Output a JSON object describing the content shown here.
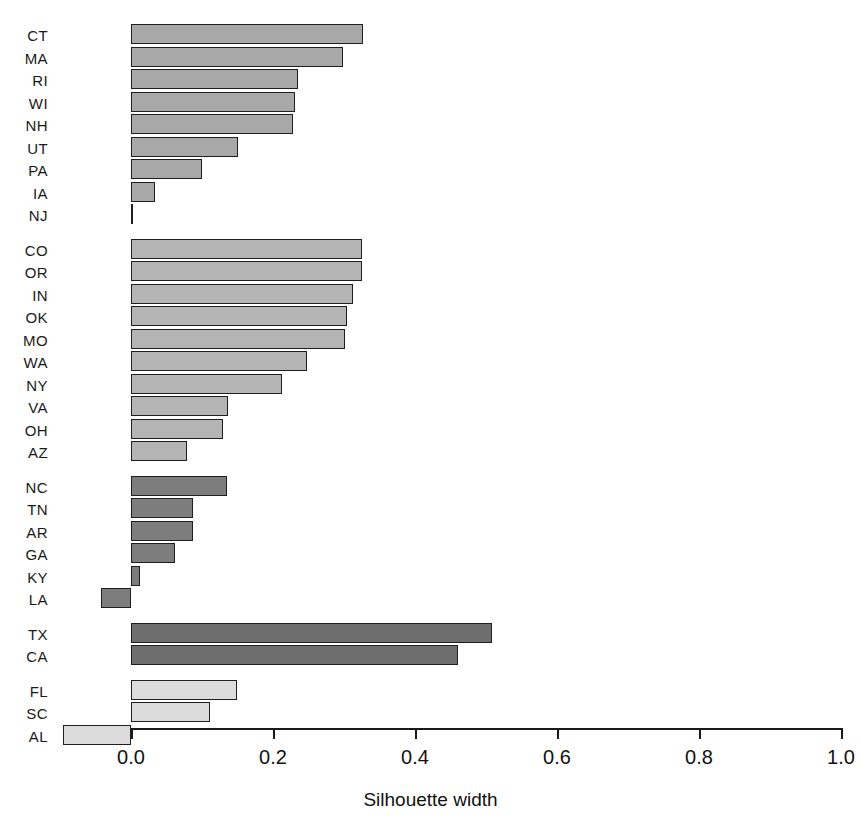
{
  "chart_data": {
    "type": "bar",
    "orientation": "horizontal",
    "title": "",
    "xlabel": "Silhouette width",
    "ylabel": "",
    "xlim": [
      -0.1,
      1.0
    ],
    "xticks": [
      "0.0",
      "0.2",
      "0.4",
      "0.6",
      "0.8",
      "1.0"
    ],
    "xtick_values": [
      0.0,
      0.2,
      0.4,
      0.6,
      0.8,
      1.0
    ],
    "grid": false,
    "legend": "none",
    "categories": [
      "CT",
      "MA",
      "RI",
      "WI",
      "NH",
      "UT",
      "PA",
      "IA",
      "NJ",
      "CO",
      "OR",
      "IN",
      "OK",
      "MO",
      "WA",
      "NY",
      "VA",
      "OH",
      "AZ",
      "NC",
      "TN",
      "AR",
      "GA",
      "KY",
      "LA",
      "TX",
      "CA",
      "FL",
      "SC",
      "AL"
    ],
    "values": [
      0.327,
      0.299,
      0.235,
      0.231,
      0.228,
      0.151,
      0.1,
      0.034,
      0.001,
      0.325,
      0.325,
      0.313,
      0.304,
      0.301,
      0.248,
      0.213,
      0.137,
      0.13,
      0.079,
      0.135,
      0.087,
      0.087,
      0.062,
      0.013,
      -0.042,
      0.508,
      0.461,
      0.149,
      0.111,
      -0.096
    ],
    "clusters": [
      {
        "index": 1,
        "color": "#a8a8a8",
        "members": [
          {
            "label": "CT",
            "value": 0.327
          },
          {
            "label": "MA",
            "value": 0.299
          },
          {
            "label": "RI",
            "value": 0.235
          },
          {
            "label": "WI",
            "value": 0.231
          },
          {
            "label": "NH",
            "value": 0.228
          },
          {
            "label": "UT",
            "value": 0.151
          },
          {
            "label": "PA",
            "value": 0.1
          },
          {
            "label": "IA",
            "value": 0.034
          },
          {
            "label": "NJ",
            "value": 0.001
          }
        ]
      },
      {
        "index": 2,
        "color": "#b4b4b4",
        "members": [
          {
            "label": "CO",
            "value": 0.325
          },
          {
            "label": "OR",
            "value": 0.325
          },
          {
            "label": "IN",
            "value": 0.313
          },
          {
            "label": "OK",
            "value": 0.304
          },
          {
            "label": "MO",
            "value": 0.301
          },
          {
            "label": "WA",
            "value": 0.248
          },
          {
            "label": "NY",
            "value": 0.213
          },
          {
            "label": "VA",
            "value": 0.137
          },
          {
            "label": "OH",
            "value": 0.13
          },
          {
            "label": "AZ",
            "value": 0.079
          }
        ]
      },
      {
        "index": 3,
        "color": "#7d7d7d",
        "members": [
          {
            "label": "NC",
            "value": 0.135
          },
          {
            "label": "TN",
            "value": 0.087
          },
          {
            "label": "AR",
            "value": 0.087
          },
          {
            "label": "GA",
            "value": 0.062
          },
          {
            "label": "KY",
            "value": 0.013
          },
          {
            "label": "LA",
            "value": -0.042
          }
        ]
      },
      {
        "index": 4,
        "color": "#6e6e6e",
        "members": [
          {
            "label": "TX",
            "value": 0.508
          },
          {
            "label": "CA",
            "value": 0.461
          }
        ]
      },
      {
        "index": 5,
        "color": "#dcdcdc",
        "members": [
          {
            "label": "FL",
            "value": 0.149
          },
          {
            "label": "SC",
            "value": 0.111
          },
          {
            "label": "AL",
            "value": -0.096
          }
        ]
      }
    ]
  },
  "axis": {
    "x_title": "Silhouette width",
    "ticks": [
      "0.0",
      "0.2",
      "0.4",
      "0.6",
      "0.8",
      "1.0"
    ]
  },
  "header": {
    "cropped_title": ""
  },
  "geometry": {
    "zero_x": 131,
    "unit_px": 710,
    "row_height": 22.5,
    "bar_height": 20,
    "first_row_top": 24,
    "group_gap": 12,
    "axis_y": 728
  }
}
